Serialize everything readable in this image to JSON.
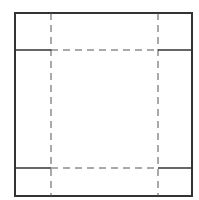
{
  "diagram": {
    "type": "box-net-fold-pattern",
    "stroke_color": "#333333",
    "background": "#ffffff",
    "outer_square": {
      "x": 15,
      "y": 13,
      "width": 177,
      "height": 183
    },
    "fold_lines": {
      "vertical_x": [
        51,
        158
      ],
      "horizontal_y": [
        50,
        168
      ]
    },
    "line_styles": {
      "cut": "solid",
      "fold": "dashed"
    }
  }
}
